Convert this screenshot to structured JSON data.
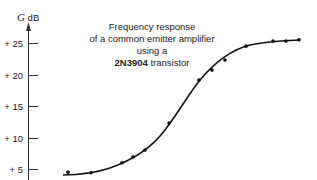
{
  "chart_data": {
    "type": "scatter",
    "title": "Frequency response of a common emitter amplifier using a 2N3904 transistor",
    "title_lines": [
      "Frequency response",
      "of a common emitter amplifier using a",
      "2N3904",
      " transistor"
    ],
    "ylabel_symbol": "G",
    "ylabel_unit": "dB",
    "xlabel": "",
    "yticks": [
      "+ 5",
      "+ 10",
      "+ 15",
      "+ 20",
      "+ 25"
    ],
    "ytick_values": [
      5,
      10,
      15,
      20,
      25
    ],
    "ylim": [
      3.5,
      27.5
    ],
    "grid": false,
    "legend": null,
    "series": [
      {
        "name": "measured",
        "style": "points",
        "x_px": [
          68,
          91,
          122,
          133,
          145,
          169,
          199,
          212,
          225,
          246,
          273,
          286,
          299
        ],
        "values": [
          4.5,
          4.4,
          6.0,
          6.9,
          8.0,
          12.3,
          19.1,
          20.7,
          22.3,
          24.5,
          25.3,
          25.3,
          25.5
        ]
      },
      {
        "name": "fitted curve",
        "style": "smooth-line"
      }
    ]
  }
}
